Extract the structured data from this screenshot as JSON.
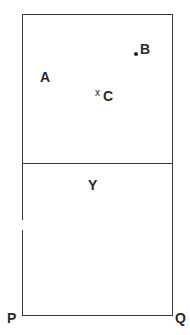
{
  "diagram": {
    "regions": {
      "upper_label": "",
      "lower_label": "Y"
    },
    "points": {
      "A": {
        "label": "A",
        "marker": "none"
      },
      "B": {
        "label": "B",
        "marker": "dot"
      },
      "C": {
        "label": "C",
        "marker": "x"
      }
    },
    "x_marker": "x",
    "corners": {
      "P": "P",
      "Q": "Q"
    },
    "colors": {
      "line": "#3a3a3a",
      "text": "#2a2a2a",
      "background": "#ffffff"
    }
  }
}
